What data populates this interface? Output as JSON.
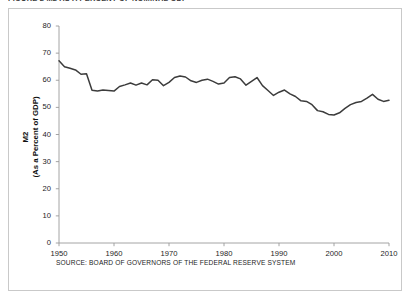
{
  "figure": {
    "caption": "FIGURE 2   M2 AS A PERCENT OF NOMINAL GDP",
    "source_note": "SOURCE: BOARD OF GOVERNORS OF THE FEDERAL RESERVE SYSTEM"
  },
  "chart_data": {
    "type": "line",
    "title": "",
    "xlabel": "",
    "ylabel": "M2 (As a Percent of GDP)",
    "ylabel_line1": "M2",
    "ylabel_line2": "(As a Percent of GDP)",
    "xlim": [
      1950,
      2010
    ],
    "ylim": [
      0,
      80
    ],
    "yticks": [
      0,
      10,
      20,
      30,
      40,
      50,
      60,
      70,
      80
    ],
    "xticks": [
      1950,
      1960,
      1970,
      1980,
      1990,
      2000,
      2010
    ],
    "grid": false,
    "legend": "none",
    "line_color": "#3c3c3c",
    "series": [
      {
        "name": "M2 as a Percent of GDP",
        "x": [
          1950,
          1951,
          1952,
          1953,
          1954,
          1955,
          1956,
          1957,
          1958,
          1959,
          1960,
          1961,
          1962,
          1963,
          1964,
          1965,
          1966,
          1967,
          1968,
          1969,
          1970,
          1971,
          1972,
          1973,
          1974,
          1975,
          1976,
          1977,
          1978,
          1979,
          1980,
          1981,
          1982,
          1983,
          1984,
          1985,
          1986,
          1987,
          1988,
          1989,
          1990,
          1991,
          1992,
          1993,
          1994,
          1995,
          1996,
          1997,
          1998,
          1999,
          2000,
          2001,
          2002,
          2003,
          2004,
          2005,
          2006,
          2007,
          2008,
          2009,
          2010
        ],
        "values": [
          67.2,
          65.0,
          64.4,
          63.8,
          62.2,
          62.4,
          56.3,
          56.0,
          56.4,
          56.2,
          56.0,
          57.7,
          58.3,
          59.0,
          58.2,
          59.0,
          58.3,
          60.2,
          60.0,
          58.0,
          59.2,
          61.0,
          61.6,
          61.2,
          59.8,
          59.2,
          60.0,
          60.4,
          59.6,
          58.6,
          59.0,
          61.0,
          61.3,
          60.5,
          58.2,
          59.6,
          61.0,
          58.0,
          56.2,
          54.4,
          55.6,
          56.4,
          55.0,
          54.0,
          52.4,
          52.2,
          51.0,
          48.8,
          48.4,
          47.4,
          47.2,
          48.0,
          49.6,
          51.0,
          51.8,
          52.2,
          53.4,
          54.8,
          53.0,
          52.2,
          52.6
        ]
      }
    ],
    "annotations": []
  },
  "axes_geometry": {
    "left_px": 50,
    "right_px": 380,
    "top_px": 17,
    "bottom_px": 234
  }
}
